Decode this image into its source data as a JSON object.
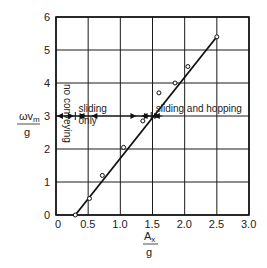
{
  "chart_data": {
    "type": "scatter",
    "title": "",
    "xlabel": "A_x / g",
    "ylabel": "ωv_m / g",
    "xlabel_parts": {
      "num": "A",
      "num_sub": "x",
      "den": "g"
    },
    "ylabel_parts": {
      "num": "ωv",
      "num_sub": "m",
      "den": "g"
    },
    "xlim": [
      0,
      3.0
    ],
    "ylim": [
      0,
      6
    ],
    "xticks": [
      "0",
      "0.5",
      "1.0",
      "1.5",
      "2.0",
      "2.5",
      "3.0"
    ],
    "yticks": [
      "0",
      "1",
      "2",
      "3",
      "4",
      "5",
      "6"
    ],
    "grid": true,
    "legend": null,
    "series": [
      {
        "name": "measured",
        "marker": "open-circle",
        "x": [
          0.3,
          0.52,
          0.72,
          1.05,
          1.35,
          1.6,
          1.85,
          2.05,
          2.5
        ],
        "y": [
          0.0,
          0.5,
          1.2,
          2.05,
          2.85,
          3.7,
          4.0,
          4.5,
          5.4
        ]
      },
      {
        "name": "fit",
        "style": "line",
        "x": [
          0.3,
          2.5
        ],
        "y": [
          0.0,
          5.4
        ]
      }
    ],
    "annotations": [
      {
        "text": "no conveying",
        "orientation": "vertical",
        "x": 0.07,
        "y": 3.0
      },
      {
        "text": "sliding",
        "x": 0.35,
        "y": 3.12
      },
      {
        "text": "only",
        "x": 0.35,
        "y": 2.75
      },
      {
        "text": "sliding and hopping",
        "x": 1.55,
        "y": 3.12
      }
    ],
    "regime_line": {
      "y": 3.0,
      "boundaries_x": [
        0.3,
        1.48
      ],
      "regimes": [
        "no conveying",
        "sliding only",
        "sliding and hopping"
      ]
    }
  }
}
